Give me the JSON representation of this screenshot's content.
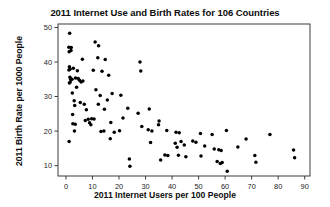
{
  "chart_data": {
    "type": "scatter",
    "title": "2011 Internet Use and Birth Rates for 106 Countries",
    "xlabel": "2011 Internet Users per 100 People",
    "ylabel": "2011 Birth Rate per 1000 People",
    "xlim": [
      -3,
      92
    ],
    "ylim": [
      7,
      51
    ],
    "xticks": [
      0,
      10,
      20,
      30,
      40,
      50,
      60,
      70,
      80,
      90
    ],
    "yticks": [
      10,
      20,
      30,
      40,
      50
    ],
    "xtick_labels": [
      "0",
      "10",
      "20",
      "30",
      "40",
      "50",
      "60",
      "70",
      "80",
      "90"
    ],
    "ytick_labels": [
      "10",
      "20",
      "30",
      "40",
      "50"
    ],
    "grid": false,
    "legend": false,
    "marker": "filled-circle",
    "marker_color": "#000000",
    "n_points": 106,
    "points": [
      [
        1.4,
        48.3
      ],
      [
        1.1,
        44.3
      ],
      [
        2.0,
        44.2
      ],
      [
        1.2,
        43.0
      ],
      [
        1.9,
        43.3
      ],
      [
        11.0,
        45.8
      ],
      [
        12.3,
        44.7
      ],
      [
        6.2,
        40.8
      ],
      [
        12.0,
        41.2
      ],
      [
        14.8,
        40.7
      ],
      [
        1.3,
        38.6
      ],
      [
        1.6,
        38.0
      ],
      [
        1.1,
        37.7
      ],
      [
        2.8,
        38.2
      ],
      [
        4.3,
        37.5
      ],
      [
        10.3,
        37.6
      ],
      [
        13.6,
        37.3
      ],
      [
        16.1,
        36.2
      ],
      [
        27.9,
        40.0
      ],
      [
        28.2,
        37.4
      ],
      [
        1.5,
        35.6
      ],
      [
        1.8,
        35.0
      ],
      [
        1.6,
        34.2
      ],
      [
        1.3,
        33.9
      ],
      [
        2.3,
        35.0
      ],
      [
        3.6,
        35.4
      ],
      [
        4.6,
        35.2
      ],
      [
        5.1,
        34.7
      ],
      [
        5.7,
        34.2
      ],
      [
        6.4,
        34.5
      ],
      [
        4.0,
        32.7
      ],
      [
        2.4,
        31.0
      ],
      [
        11.3,
        32.0
      ],
      [
        12.9,
        30.3
      ],
      [
        17.4,
        30.9
      ],
      [
        20.7,
        30.4
      ],
      [
        15.6,
        29.0
      ],
      [
        3.1,
        28.8
      ],
      [
        5.4,
        28.3
      ],
      [
        6.9,
        27.8
      ],
      [
        12.2,
        27.8
      ],
      [
        3.3,
        27.4
      ],
      [
        7.7,
        26.2
      ],
      [
        14.5,
        26.3
      ],
      [
        23.3,
        26.6
      ],
      [
        31.4,
        26.4
      ],
      [
        27.2,
        25.2
      ],
      [
        2.5,
        24.8
      ],
      [
        9.7,
        23.6
      ],
      [
        10.6,
        23.5
      ],
      [
        8.4,
        23.4
      ],
      [
        7.3,
        23.1
      ],
      [
        8.9,
        22.4
      ],
      [
        9.4,
        21.8
      ],
      [
        2.6,
        22.1
      ],
      [
        3.5,
        22.0
      ],
      [
        21.5,
        23.8
      ],
      [
        16.9,
        22.5
      ],
      [
        35.1,
        22.9
      ],
      [
        34.9,
        21.8
      ],
      [
        28.6,
        21.3
      ],
      [
        3.2,
        20.0
      ],
      [
        13.2,
        19.9
      ],
      [
        14.3,
        20.0
      ],
      [
        18.2,
        19.7
      ],
      [
        20.2,
        20.1
      ],
      [
        31.0,
        20.4
      ],
      [
        32.4,
        20.0
      ],
      [
        38.0,
        20.2
      ],
      [
        41.5,
        19.7
      ],
      [
        42.7,
        19.5
      ],
      [
        50.7,
        19.3
      ],
      [
        55.1,
        19.0
      ],
      [
        60.5,
        20.2
      ],
      [
        76.9,
        19.0
      ],
      [
        1.2,
        17.0
      ],
      [
        16.7,
        17.8
      ],
      [
        31.9,
        16.7
      ],
      [
        41.2,
        16.5
      ],
      [
        43.4,
        17.0
      ],
      [
        44.6,
        16.0
      ],
      [
        47.8,
        17.1
      ],
      [
        49.0,
        16.8
      ],
      [
        52.3,
        15.7
      ],
      [
        57.6,
        14.6
      ],
      [
        58.5,
        14.4
      ],
      [
        55.9,
        14.8
      ],
      [
        64.8,
        15.4
      ],
      [
        67.9,
        17.7
      ],
      [
        41.9,
        15.3
      ],
      [
        42.4,
        13.0
      ],
      [
        37.3,
        13.1
      ],
      [
        38.4,
        12.9
      ],
      [
        45.2,
        12.6
      ],
      [
        50.9,
        12.8
      ],
      [
        71.2,
        12.9
      ],
      [
        85.8,
        14.5
      ],
      [
        86.2,
        12.3
      ],
      [
        23.9,
        11.9
      ],
      [
        24.1,
        9.8
      ],
      [
        35.7,
        11.6
      ],
      [
        57.0,
        11.2
      ],
      [
        58.2,
        10.6
      ],
      [
        58.9,
        10.9
      ],
      [
        71.6,
        11.0
      ],
      [
        60.8,
        8.4
      ]
    ]
  }
}
